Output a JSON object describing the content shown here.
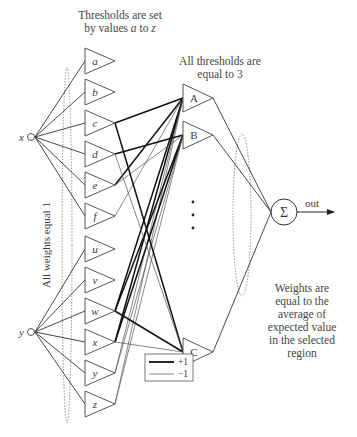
{
  "annotations": {
    "top_left_line1": "Thresholds are set",
    "top_left_line2_prefix": "by values ",
    "top_left_a": "a",
    "top_left_to": " to ",
    "top_left_z": "z",
    "top_mid_line1": "All thresholds are",
    "top_mid_line2": "equal to 3",
    "left_vertical": "All weights equal 1",
    "right_lines": [
      "Weights are",
      "equal to the",
      "average of",
      "expected value",
      "in the selected",
      "region"
    ]
  },
  "inputs": [
    {
      "id": "x",
      "label": "x",
      "cx": 31,
      "cy": 137
    },
    {
      "id": "y",
      "label": "y",
      "cx": 31,
      "cy": 332
    }
  ],
  "first_layer": [
    {
      "label": "a",
      "cy": 61,
      "group": "x"
    },
    {
      "label": "b",
      "cy": 92,
      "group": "x"
    },
    {
      "label": "c",
      "cy": 123,
      "group": "x"
    },
    {
      "label": "d",
      "cy": 154,
      "group": "x"
    },
    {
      "label": "e",
      "cy": 185,
      "group": "x"
    },
    {
      "label": "f",
      "cy": 216,
      "group": "x"
    },
    {
      "label": "u",
      "cy": 249,
      "group": "y"
    },
    {
      "label": "v",
      "cy": 280,
      "group": "y"
    },
    {
      "label": "w",
      "cy": 311,
      "group": "y"
    },
    {
      "label": "x",
      "cy": 342,
      "group": "y"
    },
    {
      "label": "y",
      "cy": 373,
      "group": "y"
    },
    {
      "label": "z",
      "cy": 404,
      "group": "y"
    }
  ],
  "second_layer": [
    {
      "label": "A",
      "cy": 98
    },
    {
      "label": "B",
      "cy": 135
    },
    {
      "label": "C",
      "cy": 352
    }
  ],
  "ellipsis": "⋮",
  "sum_node": {
    "label": "Σ",
    "cx": 284,
    "cy": 212
  },
  "output": {
    "label": "out"
  },
  "legend": {
    "items": [
      {
        "label": "+1",
        "style": "thick"
      },
      {
        "label": "−1",
        "style": "thin"
      }
    ]
  },
  "connections": {
    "to_A": [
      {
        "from": "c",
        "w": "+1"
      },
      {
        "from": "e",
        "w": "+1"
      },
      {
        "from": "f",
        "w": "-1"
      },
      {
        "from": "w",
        "w": "+1"
      },
      {
        "from": "x",
        "w": "+1"
      },
      {
        "from": "y",
        "w": "-1"
      },
      {
        "from": "z",
        "w": "-1"
      }
    ],
    "to_B": [
      {
        "from": "d",
        "w": "+1"
      },
      {
        "from": "e",
        "w": "-1"
      },
      {
        "from": "w",
        "w": "+1"
      },
      {
        "from": "x",
        "w": "+1"
      },
      {
        "from": "y",
        "w": "-1"
      },
      {
        "from": "z",
        "w": "-1"
      }
    ],
    "to_C": [
      {
        "from": "c",
        "w": "+1"
      },
      {
        "from": "d",
        "w": "-1"
      },
      {
        "from": "w",
        "w": "+1"
      },
      {
        "from": "x",
        "w": "-1"
      }
    ]
  }
}
